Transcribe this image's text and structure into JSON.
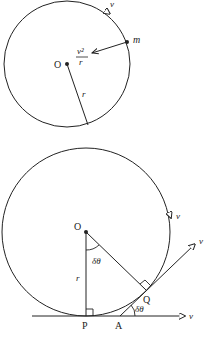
{
  "top_diagram": {
    "center_label": "O",
    "mass_label": "m",
    "velocity_label": "v",
    "acceleration_numerator": "v²",
    "acceleration_denominator": "r",
    "radius_label": "r"
  },
  "bottom_diagram": {
    "center_label": "O",
    "radius_label": "r",
    "angle_at_center_label": "δθ",
    "angle_at_A_label": "δθ",
    "point_P_label": "P",
    "point_A_label": "A",
    "point_Q_label": "Q",
    "velocity_circle_label": "v",
    "velocity_tangent_label": "v",
    "velocity_horizontal_label": "v"
  },
  "colors": {
    "stroke": "#222222",
    "background": "#ffffff"
  }
}
